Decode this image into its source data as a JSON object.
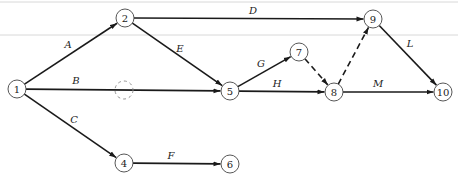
{
  "diagram": {
    "type": "activity-on-arrow network",
    "colors": {
      "line": "#1a1a1a",
      "node_stroke": "#444444",
      "rule": "#d8d8d8"
    },
    "nodes": [
      {
        "id": "1",
        "label": "1",
        "x": 17,
        "y": 89
      },
      {
        "id": "2",
        "label": "2",
        "x": 125,
        "y": 18
      },
      {
        "id": "4",
        "label": "4",
        "x": 124,
        "y": 163
      },
      {
        "id": "5",
        "label": "5",
        "x": 230,
        "y": 91
      },
      {
        "id": "6",
        "label": "6",
        "x": 230,
        "y": 164
      },
      {
        "id": "7",
        "label": "7",
        "x": 299,
        "y": 52
      },
      {
        "id": "8",
        "label": "8",
        "x": 334,
        "y": 92
      },
      {
        "id": "9",
        "label": "9",
        "x": 373,
        "y": 19
      },
      {
        "id": "10",
        "label": "10",
        "x": 443,
        "y": 92
      }
    ],
    "ghost_node": {
      "x": 124,
      "y": 90
    },
    "edges": [
      {
        "from": "1",
        "to": "2",
        "label": "A",
        "dummy": false
      },
      {
        "from": "1",
        "to": "5",
        "label": "B",
        "dummy": false
      },
      {
        "from": "1",
        "to": "4",
        "label": "C",
        "dummy": false
      },
      {
        "from": "2",
        "to": "9",
        "label": "D",
        "dummy": false
      },
      {
        "from": "2",
        "to": "5",
        "label": "E",
        "dummy": false
      },
      {
        "from": "4",
        "to": "6",
        "label": "F",
        "dummy": false
      },
      {
        "from": "5",
        "to": "7",
        "label": "G",
        "dummy": false
      },
      {
        "from": "5",
        "to": "8",
        "label": "H",
        "dummy": false
      },
      {
        "from": "7",
        "to": "8",
        "label": "",
        "dummy": true
      },
      {
        "from": "8",
        "to": "9",
        "label": "",
        "dummy": true
      },
      {
        "from": "9",
        "to": "10",
        "label": "L",
        "dummy": false
      },
      {
        "from": "8",
        "to": "10",
        "label": "M",
        "dummy": false
      }
    ],
    "edge_labels": {
      "A": {
        "text": "A",
        "x": 68,
        "y": 48
      },
      "B": {
        "text": "B",
        "x": 76,
        "y": 84
      },
      "C": {
        "text": "C",
        "x": 74,
        "y": 123
      },
      "D": {
        "text": "D",
        "x": 253,
        "y": 14
      },
      "E": {
        "text": "E",
        "x": 180,
        "y": 52
      },
      "F": {
        "text": "F",
        "x": 171,
        "y": 159
      },
      "G": {
        "text": "G",
        "x": 261,
        "y": 67
      },
      "H": {
        "text": "H",
        "x": 277,
        "y": 87
      },
      "L": {
        "text": "L",
        "x": 410,
        "y": 47
      },
      "M": {
        "text": "M",
        "x": 378,
        "y": 87
      }
    }
  }
}
